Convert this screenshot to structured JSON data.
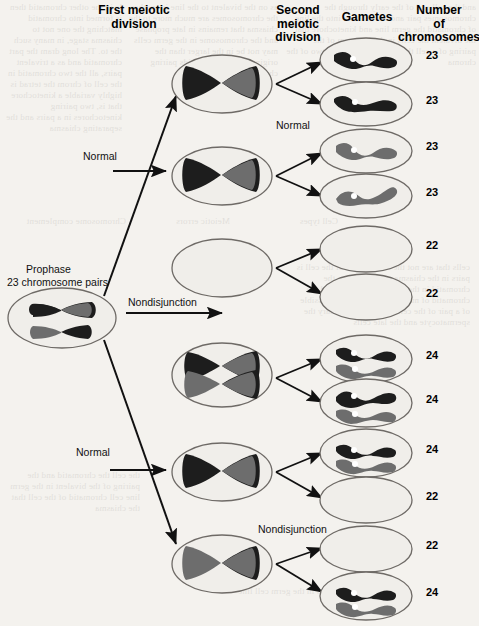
{
  "figure": {
    "kind": "meiosis-nondisjunction-diagram",
    "headers": [
      {
        "name": "first-meiotic-division",
        "text": "First meiotic\ndivision",
        "x": 74,
        "y": 4,
        "w": 120
      },
      {
        "name": "second-meiotic-division",
        "text": "Second\nmeiotic\ndivision",
        "x": 262,
        "y": 4,
        "w": 72
      },
      {
        "name": "gametes",
        "text": "Gametes",
        "x": 334,
        "y": 11,
        "w": 66
      },
      {
        "name": "number-of-chromosomes",
        "text": "Number\nof\nchromosomes",
        "x": 398,
        "y": 4,
        "w": 82
      }
    ],
    "captions": [
      {
        "name": "prophase-caption-line1",
        "text": "Prophase",
        "x": 26,
        "y": 263
      },
      {
        "name": "prophase-caption-line2",
        "text": "23 chromosome pairs",
        "x": 7,
        "y": 276
      },
      {
        "name": "label-normal-top",
        "text": "Normal",
        "x": 83,
        "y": 150
      },
      {
        "name": "label-nondisjunction-meiosis1",
        "text": "Nondisjunction",
        "x": 128,
        "y": 296
      },
      {
        "name": "label-normal-bottom",
        "text": "Normal",
        "x": 76,
        "y": 446
      },
      {
        "name": "label-normal-second-division",
        "text": "Normal",
        "x": 276,
        "y": 119
      },
      {
        "name": "label-nondisjunction-meiosis2",
        "text": "Nondisjunction",
        "x": 258,
        "y": 523
      }
    ],
    "meiosis1_cells": [
      {
        "name": "meiosis1-cell-normal-a",
        "cx": 222,
        "cy": 84,
        "content": "tetrad-split-dark-left-gray-right",
        "count": 1
      },
      {
        "name": "meiosis1-cell-normal-b",
        "cx": 222,
        "cy": 176,
        "content": "tetrad-split-dark-left-gray-right",
        "count": 1
      },
      {
        "name": "meiosis1-cell-empty-nondisjunction",
        "cx": 222,
        "cy": 268,
        "content": "empty",
        "count": 0
      },
      {
        "name": "meiosis1-cell-double-nondisjunction",
        "cx": 222,
        "cy": 375,
        "content": "two-tetrads",
        "count": 2
      },
      {
        "name": "meiosis1-cell-normal-c",
        "cx": 222,
        "cy": 472,
        "content": "tetrad-split-dark-left-gray-right",
        "count": 1
      },
      {
        "name": "meiosis1-cell-normal-d",
        "cx": 222,
        "cy": 564,
        "content": "tetrad-split-gray-left-dark-right",
        "count": 1
      }
    ],
    "gametes": [
      {
        "name": "gamete-1",
        "cx": 366,
        "cy": 60,
        "chromosomes": [
          "dark"
        ],
        "number": "23",
        "num_y": 49
      },
      {
        "name": "gamete-2",
        "cx": 366,
        "cy": 104,
        "chromosomes": [
          "dark"
        ],
        "number": "23",
        "num_y": 94
      },
      {
        "name": "gamete-3",
        "cx": 366,
        "cy": 151,
        "chromosomes": [
          "gray"
        ],
        "number": "23",
        "num_y": 140
      },
      {
        "name": "gamete-4",
        "cx": 366,
        "cy": 196,
        "chromosomes": [
          "gray"
        ],
        "number": "23",
        "num_y": 186
      },
      {
        "name": "gamete-5",
        "cx": 366,
        "cy": 249,
        "chromosomes": [],
        "number": "22",
        "num_y": 239
      },
      {
        "name": "gamete-6",
        "cx": 366,
        "cy": 297,
        "chromosomes": [],
        "number": "22",
        "num_y": 287
      },
      {
        "name": "gamete-7",
        "cx": 366,
        "cy": 359,
        "chromosomes": [
          "dark",
          "gray"
        ],
        "number": "24",
        "num_y": 349
      },
      {
        "name": "gamete-8",
        "cx": 366,
        "cy": 403,
        "chromosomes": [
          "dark",
          "gray"
        ],
        "number": "24",
        "num_y": 393
      },
      {
        "name": "gamete-9",
        "cx": 366,
        "cy": 453,
        "chromosomes": [
          "dark",
          "gray"
        ],
        "number": "24",
        "num_y": 443
      },
      {
        "name": "gamete-10",
        "cx": 366,
        "cy": 500,
        "chromosomes": [],
        "number": "22",
        "num_y": 490
      },
      {
        "name": "gamete-11",
        "cx": 366,
        "cy": 549,
        "chromosomes": [],
        "number": "22",
        "num_y": 539
      },
      {
        "name": "gamete-12",
        "cx": 366,
        "cy": 596,
        "chromosomes": [
          "dark",
          "gray"
        ],
        "number": "24",
        "num_y": 586
      }
    ],
    "prophase_cell": {
      "name": "prophase-cell",
      "cx": 62,
      "cy": 318,
      "content": "two-tetrads"
    },
    "colors": {
      "page_background": "#f4f2ee",
      "cell_outline": "#6e6a66",
      "cell_fill": "#f0eeea",
      "chromosome_dark": "#1d1d1d",
      "chromosome_gray": "#6d6d6d",
      "centromere": "#ffffff",
      "arrow": "#111111",
      "text": "#000000"
    },
    "ghost_text": {
      "note": "faint mirrored show-through text from the reverse side of the printed page",
      "lines": [
        "blocks of reversed body text visible behind the diagram",
        "Chromosome   Meiotic   Cell types",
        "complement   errors"
      ]
    }
  }
}
